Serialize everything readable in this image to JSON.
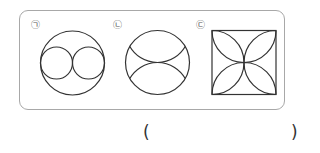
{
  "question": {
    "figures": [
      {
        "label": "㉠",
        "shape": "circle-with-two-inner-circles"
      },
      {
        "label": "㉡",
        "shape": "circle-with-two-arcs"
      },
      {
        "label": "㉢",
        "shape": "square-with-four-petals"
      }
    ],
    "answer_open": "(",
    "answer_close": ")",
    "answer_value": ""
  },
  "colors": {
    "stroke": "#333333",
    "panel_border": "#a8a8a8"
  }
}
